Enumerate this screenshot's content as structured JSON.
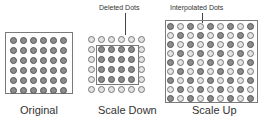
{
  "panels": {
    "original": {
      "caption": "Original",
      "cols": 6,
      "rows": 6,
      "pattern": "all-dark"
    },
    "scale_down": {
      "caption": "Scale Down",
      "callout": "Deleted Dots",
      "cols": 6,
      "rows": 6,
      "pattern": "outer-ring-light"
    },
    "scale_up": {
      "caption": "Scale Up",
      "callout": "Interpolated Dots",
      "cols": 9,
      "rows": 9,
      "pattern": "checkerboard"
    }
  },
  "colors": {
    "dark_dot": "#8c8c8c",
    "light_dot": "#e4e4e4",
    "outline": "#7a7a7a"
  }
}
